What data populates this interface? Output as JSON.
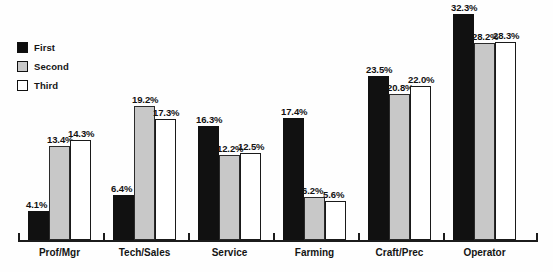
{
  "chart_data": {
    "type": "bar",
    "title": "",
    "xlabel": "",
    "ylabel": "",
    "ylim": [
      0,
      34
    ],
    "grid": false,
    "legend_position": "top-left",
    "categories": [
      "Prof/Mgr",
      "Tech/Sales",
      "Service",
      "Farming",
      "Craft/Prec",
      "Operator"
    ],
    "series": [
      {
        "name": "First",
        "color": "#111111",
        "values": [
          4.1,
          6.4,
          16.3,
          17.4,
          23.5,
          32.3
        ]
      },
      {
        "name": "Second",
        "color": "#c8c8c8",
        "values": [
          13.4,
          19.2,
          12.2,
          6.2,
          20.8,
          28.2
        ]
      },
      {
        "name": "Third",
        "color": "#ffffff",
        "values": [
          14.3,
          17.3,
          12.5,
          5.6,
          22.0,
          28.3
        ]
      }
    ],
    "value_labels": [
      [
        "4.1%",
        "13.4%",
        "14.3%"
      ],
      [
        "6.4%",
        "19.2%",
        "17.3%"
      ],
      [
        "16.3%",
        "12.2%",
        "12.5%"
      ],
      [
        "17.4%",
        "6.2%",
        "5.6%"
      ],
      [
        "23.5%",
        "20.8%",
        "22.0%"
      ],
      [
        "32.3%",
        "28.2%",
        "28.3%"
      ]
    ]
  },
  "legend": {
    "items": [
      {
        "label": "First",
        "swatch": "sw-first"
      },
      {
        "label": "Second",
        "swatch": "sw-second"
      },
      {
        "label": "Third",
        "swatch": "sw-third"
      }
    ]
  },
  "caption": {
    "text": ""
  }
}
